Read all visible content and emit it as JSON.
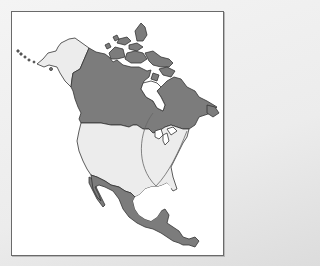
{
  "map": {
    "subject": "North America",
    "regions": [
      {
        "name": "Canada",
        "fill": "#7c7c7c"
      },
      {
        "name": "Alaska",
        "fill": "#ececec"
      },
      {
        "name": "United States (contiguous)",
        "fill": "#ececec"
      },
      {
        "name": "Mexico and Central America",
        "fill": "#7c7c7c"
      },
      {
        "name": "Hudson Bay",
        "fill": "#ffffff"
      }
    ],
    "overlay": {
      "description": "Two curved lines from the Great Lakes area converging at the Gulf Coast (New Orleans)",
      "stroke": "#666666"
    },
    "colors": {
      "dark_fill": "#7c7c7c",
      "light_fill": "#ececec",
      "outline": "#333333",
      "water": "#ffffff",
      "frame_border": "#6a6a6a"
    }
  }
}
